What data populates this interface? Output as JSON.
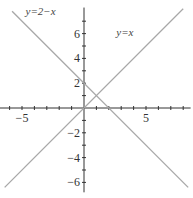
{
  "chart_data": {
    "type": "line",
    "title": "",
    "xlabel": "",
    "ylabel": "",
    "xlim": [
      -6.8,
      8.6
    ],
    "ylim": [
      -6.8,
      8.1
    ],
    "grid": false,
    "x_ticks": [
      -6,
      -5,
      -4,
      -3,
      -2,
      -1,
      1,
      2,
      3,
      4,
      5,
      6,
      7,
      8
    ],
    "x_tick_labels": [
      {
        "value": -5,
        "label": "−5"
      },
      {
        "value": 5,
        "label": "5"
      }
    ],
    "y_ticks": [
      -6,
      -5,
      -4,
      -3,
      -2,
      -1,
      1,
      2,
      3,
      4,
      5,
      6,
      7
    ],
    "y_tick_labels": [
      {
        "value": 6,
        "label": "6"
      },
      {
        "value": 4,
        "label": "4"
      },
      {
        "value": 2,
        "label": "2"
      },
      {
        "value": -2,
        "label": "−2"
      },
      {
        "value": -4,
        "label": "−4"
      },
      {
        "value": -6,
        "label": "−6"
      }
    ],
    "series": [
      {
        "name": "y=x",
        "label": "y=x",
        "x": [
          -6.4,
          8
        ],
        "y": [
          -6.4,
          8
        ]
      },
      {
        "name": "y=2−x",
        "label": "y=2−x",
        "x": [
          -5.8,
          8.4
        ],
        "y": [
          7.8,
          -6.4
        ]
      }
    ],
    "annotations": [
      {
        "text": "y=2−x",
        "x": -3.5,
        "y": 7.5
      },
      {
        "text": "y=x",
        "x": 3.3,
        "y": 5.8
      }
    ],
    "intersection": {
      "x": 1,
      "y": 1
    }
  }
}
